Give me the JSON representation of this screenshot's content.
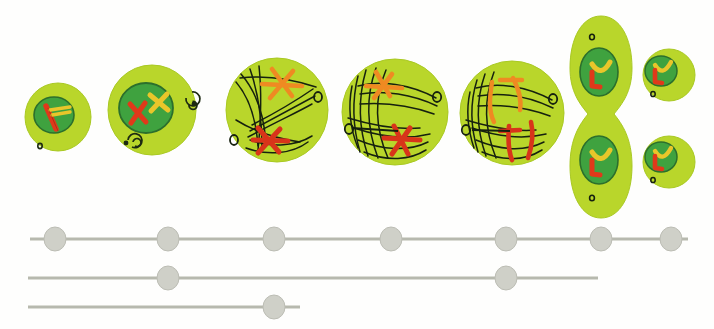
{
  "figure": {
    "background_color": "#fefefd",
    "width": 714,
    "height": 329
  },
  "palette": {
    "cytoplasm": "#b9d62b",
    "cytoplasm_edge": "#a9c922",
    "nucleus": "#3fa23f",
    "nucleus_edge": "#2f7c2f",
    "chromosome_red": "#e0391a",
    "chromosome_orange": "#ef8a22",
    "chromosome_yellow": "#e9c62a",
    "spindle_fiber": "#16210f",
    "centriole_outline": "#1d2a12",
    "track_line": "#b7b9ae",
    "track_node": "#cfd0c8",
    "track_node_edge": "#bcbdb4"
  },
  "cells": [
    {
      "name": "cell-stage-1-interphase",
      "label": "interphase",
      "cx": 58,
      "cy": 117,
      "rx": 33,
      "ry": 34,
      "nucleus": {
        "cx": 54,
        "cy": 115,
        "rx": 20,
        "ry": 18
      },
      "chromosomes": [
        "red-rod",
        "yellow-pair"
      ],
      "centrioles": 1
    },
    {
      "name": "cell-stage-2-prophase",
      "label": "prophase",
      "cx": 152,
      "cy": 110,
      "rx": 44,
      "ry": 45,
      "nucleus": {
        "cx": 146,
        "cy": 108,
        "rx": 27,
        "ry": 25
      },
      "chromosomes": [
        "red-cross",
        "yellow-cross"
      ],
      "centrioles": 2
    },
    {
      "name": "cell-stage-3-prometaphase",
      "label": "prometaphase",
      "cx": 277,
      "cy": 110,
      "rx": 51,
      "ry": 52,
      "chromosomes": [
        "orange-cross",
        "red-cross"
      ],
      "spindle": true,
      "centrioles": 2
    },
    {
      "name": "cell-stage-4-metaphase",
      "label": "metaphase",
      "cx": 395,
      "cy": 112,
      "rx": 53,
      "ry": 53,
      "chromosomes": [
        "orange-cross",
        "red-cross"
      ],
      "spindle": true,
      "centrioles": 2
    },
    {
      "name": "cell-stage-5-anaphase",
      "label": "anaphase",
      "cx": 512,
      "cy": 113,
      "rx": 52,
      "ry": 52,
      "chromosomes": [
        "orange-split",
        "red-split"
      ],
      "spindle": true,
      "centrioles": 2
    },
    {
      "name": "cell-stage-6-telophase",
      "label": "telophase",
      "cx": 601,
      "cy": 117,
      "rx": 31,
      "ry": 102,
      "daughter_nuclei": 2,
      "centrioles": 2
    },
    {
      "name": "cell-stage-7-daughter-cells",
      "label": "daughter cells",
      "cells": [
        {
          "cx": 668,
          "cy": 75,
          "rx": 26,
          "ry": 26,
          "nucleus": {
            "cx": 661,
            "cy": 71,
            "rx": 16,
            "ry": 15
          }
        },
        {
          "cx": 668,
          "cy": 162,
          "rx": 26,
          "ry": 26,
          "nucleus": {
            "cx": 661,
            "cy": 157,
            "rx": 16,
            "ry": 15
          }
        }
      ]
    }
  ],
  "timeline": {
    "name": "chromosome-tracks",
    "rows": [
      {
        "name": "track-row-1",
        "y": 239,
        "x_start": 30,
        "x_end": 688,
        "nodes": [
          55,
          168,
          274,
          391,
          506,
          601,
          671
        ]
      },
      {
        "name": "track-row-2",
        "y": 278,
        "x_start": 28,
        "x_end": 598,
        "nodes": [
          168,
          506
        ]
      },
      {
        "name": "track-row-3",
        "y": 307,
        "x_start": 28,
        "x_end": 300,
        "nodes": [
          274
        ]
      }
    ],
    "node_radius_x": 11,
    "node_radius_y": 12,
    "line_thickness": 3
  }
}
